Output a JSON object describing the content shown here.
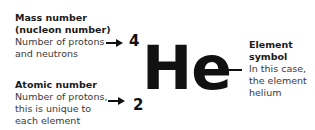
{
  "mass": {
    "title1": "Mass number",
    "title2": "(nucleon number)",
    "desc1": "Number of protons",
    "desc2": "and neutrons",
    "value": "4"
  },
  "atomic": {
    "title": "Atomic number",
    "desc1": "Number of protons,",
    "desc2": "this is unique to",
    "desc3": "each element",
    "value": "2"
  },
  "symbol": {
    "text": "He",
    "title1": "Element",
    "title2": "symbol",
    "desc1": "In this case,",
    "desc2": "the element",
    "desc3": "helium"
  }
}
